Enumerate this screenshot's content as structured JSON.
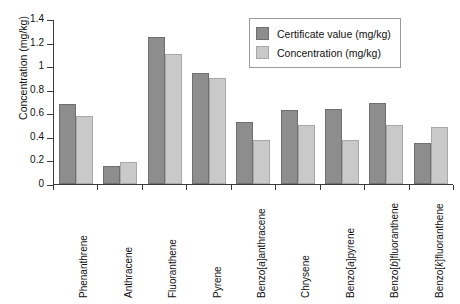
{
  "chart_data": {
    "type": "bar",
    "title": "",
    "xlabel": "",
    "ylabel": "Concentration (mg/kg)",
    "ylim": [
      0,
      1.4
    ],
    "ytick_labels": [
      "1.4",
      "1.2",
      "1",
      "0.8",
      "0.6",
      "0.4",
      "0.2",
      "0"
    ],
    "ytick_values": [
      1.4,
      1.2,
      1.0,
      0.8,
      0.6,
      0.4,
      0.2,
      0
    ],
    "grid": false,
    "legend_position": "top-right",
    "categories": [
      "Phenanthrene",
      "Anthracene",
      "Fluoranthene",
      "Pyrene",
      "Benzo[a]anthracene",
      "Chrysene",
      "Benzo[a]pyrene",
      "Benzo[b]fluoranthene",
      "Benzo[k]fluoranthene"
    ],
    "category_parts": [
      {
        "pre": "Phenanthrene",
        "italic": "",
        "post": ""
      },
      {
        "pre": "Anthracene",
        "italic": "",
        "post": ""
      },
      {
        "pre": "Fluoranthene",
        "italic": "",
        "post": ""
      },
      {
        "pre": "Pyrene",
        "italic": "",
        "post": ""
      },
      {
        "pre": "Benzo[",
        "italic": "a",
        "post": "]anthracene"
      },
      {
        "pre": "Chrysene",
        "italic": "",
        "post": ""
      },
      {
        "pre": "Benzo[",
        "italic": "a",
        "post": "]pyrene"
      },
      {
        "pre": "Benzo[",
        "italic": "b",
        "post": "]fluoranthene"
      },
      {
        "pre": "Benzo[",
        "italic": "k",
        "post": "]fluoranthene"
      }
    ],
    "series": [
      {
        "name": "Certificate value (mg/kg)",
        "color": "#8d8d8d",
        "values": [
          0.68,
          0.15,
          1.25,
          0.94,
          0.53,
          0.63,
          0.64,
          0.69,
          0.35
        ]
      },
      {
        "name": "Concentration (mg/kg)",
        "color": "#c9c9c9",
        "values": [
          0.58,
          0.19,
          1.1,
          0.9,
          0.37,
          0.5,
          0.37,
          0.5,
          0.48
        ]
      }
    ]
  }
}
